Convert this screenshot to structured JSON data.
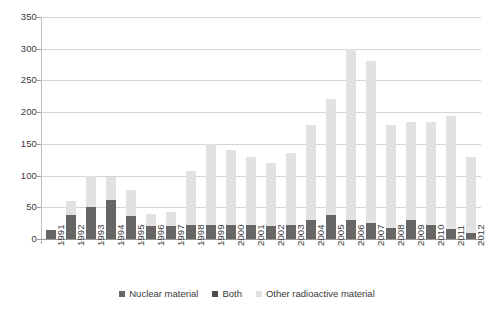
{
  "chart_data": {
    "type": "bar",
    "stacked": true,
    "title": "",
    "subtitle": "",
    "xlabel": "",
    "ylabel": "",
    "ylim": [
      0,
      350
    ],
    "ytick_step": 50,
    "yticks": [
      0,
      50,
      100,
      150,
      200,
      250,
      300,
      350
    ],
    "ytick_labels": [
      "0",
      "50",
      "100",
      "150",
      "200",
      "250",
      "300",
      "350"
    ],
    "grid": "horizontal",
    "legend_position": "bottom-center",
    "categories": [
      "1991",
      "1992",
      "1993",
      "1994",
      "1995",
      "1996",
      "1997",
      "1998",
      "1999",
      "2000",
      "2001",
      "2002",
      "2003",
      "2004",
      "2005",
      "2006",
      "2007",
      "2008",
      "2009",
      "2010",
      "2011",
      "2012"
    ],
    "series": [
      {
        "name": "Nuclear material",
        "color": "#666666",
        "values": [
          14,
          38,
          50,
          62,
          37,
          20,
          20,
          22,
          22,
          22,
          22,
          20,
          22,
          30,
          38,
          30,
          25,
          18,
          30,
          22,
          16,
          10
        ]
      },
      {
        "name": "Both",
        "color": "#4d4d4d",
        "values": [
          0,
          0,
          0,
          0,
          0,
          0,
          0,
          0,
          0,
          0,
          0,
          0,
          0,
          0,
          0,
          0,
          0,
          0,
          0,
          0,
          0,
          0
        ]
      },
      {
        "name": "Other radioactive material",
        "color": "#e2e2e2",
        "values": [
          0,
          22,
          50,
          36,
          40,
          20,
          23,
          85,
          128,
          118,
          108,
          100,
          113,
          150,
          183,
          270,
          255,
          162,
          155,
          163,
          178,
          120
        ]
      }
    ],
    "totals": [
      14,
      60,
      100,
      98,
      77,
      40,
      43,
      107,
      150,
      140,
      130,
      120,
      135,
      180,
      221,
      300,
      280,
      180,
      185,
      185,
      194,
      130
    ]
  },
  "legend": {
    "items": [
      {
        "label": "Nuclear material",
        "color": "#666666"
      },
      {
        "label": "Both",
        "color": "#4d4d4d"
      },
      {
        "label": "Other radioactive material",
        "color": "#e2e2e2"
      }
    ]
  },
  "colors": {
    "grid": "#d4d4d4",
    "axis": "#9a9a9a",
    "text": "#3a3a3a",
    "background": "#ffffff"
  }
}
